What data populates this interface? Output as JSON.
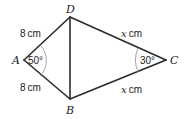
{
  "figure": {
    "vertices": {
      "A": "A",
      "B": "B",
      "C": "C",
      "D": "D"
    },
    "sides": {
      "AD": {
        "value": "8",
        "unit": "cm"
      },
      "AB": {
        "value": "8",
        "unit": "cm"
      },
      "DC": {
        "value": "x",
        "unit": "cm"
      },
      "BC": {
        "value": "x",
        "unit": "cm"
      }
    },
    "angles": {
      "A": "50°",
      "C": "30°"
    },
    "segments": [
      "AD",
      "AB",
      "DC",
      "BC",
      "DB"
    ]
  }
}
